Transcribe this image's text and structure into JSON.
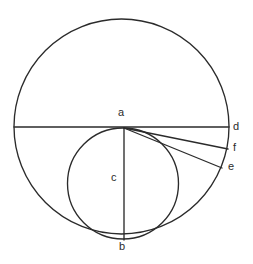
{
  "diagram": {
    "background_color": "#ffffff",
    "stroke_color": "#2b2b2b",
    "label_color": "#2b2b2b",
    "canvas": {
      "width": 253,
      "height": 264
    },
    "labels": {
      "a": "a",
      "b": "b",
      "c": "c",
      "d": "d",
      "e": "e",
      "f": "f"
    },
    "label_positions": {
      "a": {
        "x": 118,
        "y": 107
      },
      "b": {
        "x": 119,
        "y": 241
      },
      "c": {
        "x": 111,
        "y": 172
      },
      "d": {
        "x": 233,
        "y": 121
      },
      "e": {
        "x": 228,
        "y": 161
      },
      "f": {
        "x": 233,
        "y": 142
      }
    },
    "shapes": {
      "outer_circle": {
        "cx": 121.5,
        "cy": 126.5,
        "r": 107.5
      },
      "inner_circle": {
        "cx": 123,
        "cy": 183.5,
        "r": 55.5
      },
      "horizontal_chord": {
        "x1": 14,
        "y1": 127,
        "x2": 229,
        "y2": 127
      },
      "vertical_diameter": {
        "x1": 124,
        "y1": 128,
        "x2": 124,
        "y2": 240
      },
      "line_a_to_f": {
        "x1": 124,
        "y1": 128,
        "x2": 228,
        "y2": 149
      },
      "line_a_to_e": {
        "x1": 124,
        "y1": 128,
        "x2": 222,
        "y2": 168
      }
    },
    "points": {
      "a": {
        "x": 124,
        "y": 128,
        "role": "top-of-inner-circle-on-chord"
      },
      "b": {
        "x": 124,
        "y": 240,
        "role": "bottom-tangent-point"
      },
      "c": {
        "x": 123,
        "y": 183,
        "role": "inner-circle-center"
      },
      "d": {
        "x": 229,
        "y": 127,
        "role": "chord-endpoint-on-outer-circle"
      },
      "e": {
        "x": 222,
        "y": 168,
        "role": "outer-circle-point"
      },
      "f": {
        "x": 228,
        "y": 149,
        "role": "outer-circle-point"
      }
    }
  }
}
